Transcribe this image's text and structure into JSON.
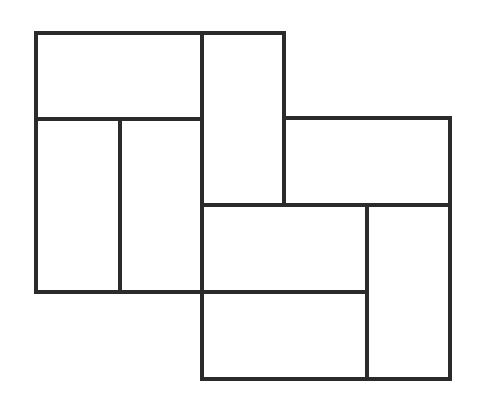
{
  "diagram": {
    "type": "rectangle-tiling",
    "stroke_color": "#2b2b2b",
    "stroke_width": 4,
    "background": "#ffffff",
    "rects": [
      {
        "id": "top-left-wide",
        "x": 36,
        "y": 33,
        "w": 166,
        "h": 86
      },
      {
        "id": "left-lower-a",
        "x": 36,
        "y": 119,
        "w": 84,
        "h": 173
      },
      {
        "id": "left-lower-b",
        "x": 120,
        "y": 119,
        "w": 82,
        "h": 173
      },
      {
        "id": "center-tall",
        "x": 202,
        "y": 33,
        "w": 82,
        "h": 172
      },
      {
        "id": "right-upper-wide",
        "x": 284,
        "y": 118,
        "w": 166,
        "h": 87
      },
      {
        "id": "center-mid-wide",
        "x": 202,
        "y": 205,
        "w": 165,
        "h": 87
      },
      {
        "id": "center-bottom-wide",
        "x": 202,
        "y": 292,
        "w": 165,
        "h": 87
      },
      {
        "id": "right-tall",
        "x": 367,
        "y": 205,
        "w": 83,
        "h": 174
      }
    ]
  }
}
